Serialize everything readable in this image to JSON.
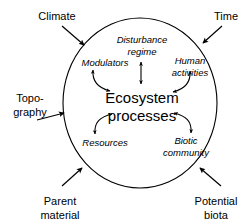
{
  "diagram": {
    "center": {
      "line1": "Ecosystem",
      "line2": "processes"
    },
    "boundary": {
      "shape": "circle",
      "name": "ecosystem-boundary"
    },
    "internal_components": [
      {
        "id": "disturbance-regime",
        "line1": "Disturbance",
        "line2": "regime",
        "style": "italic",
        "position": "top-center",
        "connector": "double-headed-vertical-arrow"
      },
      {
        "id": "modulators",
        "line1": "Modulators",
        "line2": "",
        "style": "italic",
        "position": "upper-left",
        "connector": "double-headed-curved-arrow"
      },
      {
        "id": "human-activities",
        "line1": "Human",
        "line2": "activities",
        "style": "italic",
        "position": "upper-right",
        "connector": "double-headed-curved-arrow"
      },
      {
        "id": "resources",
        "line1": "Resources",
        "line2": "",
        "style": "italic",
        "position": "lower-left",
        "connector": "double-headed-curved-arrow"
      },
      {
        "id": "biotic-community",
        "line1": "Biotic",
        "line2": "community",
        "style": "italic",
        "position": "lower-right",
        "connector": "double-headed-curved-arrow"
      }
    ],
    "external_drivers": [
      {
        "id": "climate",
        "line1": "Climate",
        "line2": "",
        "position": "top-left",
        "arrow_direction": "down-right"
      },
      {
        "id": "time",
        "line1": "Time",
        "line2": "",
        "position": "top-right",
        "arrow_direction": "down-left"
      },
      {
        "id": "topography",
        "line1": "Topo-",
        "line2": "graphy",
        "position": "left",
        "arrow_direction": "right"
      },
      {
        "id": "parent-material",
        "line1": "Parent",
        "line2": "material",
        "position": "bottom-left",
        "arrow_direction": "up-right"
      },
      {
        "id": "potential-biota",
        "line1": "Potential",
        "line2": "biota",
        "position": "bottom-right",
        "arrow_direction": "up-left"
      }
    ],
    "colors": {
      "stroke": "#000000",
      "text": "#000000",
      "background": "#ffffff"
    }
  }
}
